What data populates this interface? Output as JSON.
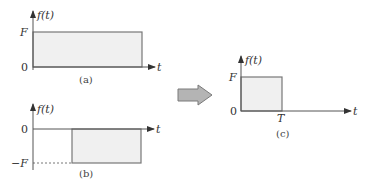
{
  "colors": {
    "axis": "#555555",
    "signal_stroke": "#777777",
    "fill": "#f0f0f0",
    "arrow_fill": "#b4b4b4",
    "arrow_stroke": "#7a7a7a"
  },
  "panels": {
    "a": {
      "y_axis_label": "f(t)",
      "x_axis_label": "t",
      "level_label": "F",
      "zero_label": "0",
      "caption": "(a)"
    },
    "b": {
      "y_axis_label": "f(t)",
      "x_axis_label": "t",
      "level_label": "−F",
      "zero_label": "0",
      "caption": "(b)"
    },
    "c": {
      "y_axis_label": "f(t)",
      "x_axis_label": "t",
      "level_label": "F",
      "zero_label": "0",
      "time_label": "T",
      "caption": "(c)"
    }
  },
  "transform_arrow": {
    "icon": "right-arrow-icon",
    "direction": "right"
  }
}
